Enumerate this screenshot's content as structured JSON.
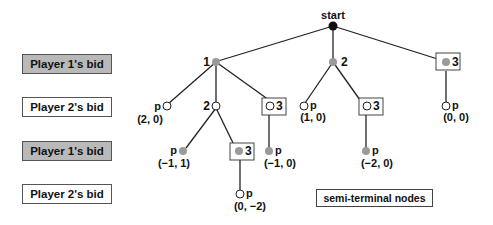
{
  "row_labels": [
    {
      "label": "Player 1's bid",
      "style": "shaded"
    },
    {
      "label": "Player 2's bid",
      "style": "plain"
    },
    {
      "label": "Player 1's bid",
      "style": "shaded"
    },
    {
      "label": "Player 2's bid",
      "style": "plain"
    }
  ],
  "tree": {
    "root_label": "start",
    "colors": {
      "root": "#111111",
      "player1_node": "#9a9a9a",
      "player2_node": "#ffffff",
      "edge": "#222222"
    },
    "level1": {
      "bid1": "1",
      "bid2": "2",
      "bid3": "3"
    },
    "level2": {
      "after1_pass": "p",
      "after1_pass_payoff": "(2, 0)",
      "after1_bid2": "2",
      "after1_bid3": "3",
      "after2_pass": "p",
      "after2_pass_payoff": "(1, 0)",
      "after2_bid3": "3",
      "after3_pass": "p",
      "after3_pass_payoff": "(0, 0)"
    },
    "level3": {
      "after12_pass": "p",
      "after12_pass_payoff": "(−1, 1)",
      "after12_bid3": "3",
      "after13_pass": "p",
      "after13_pass_payoff": "(−1, 0)",
      "after23_pass": "p",
      "after23_pass_payoff": "(−2, 0)"
    },
    "level4": {
      "after123_pass": "p",
      "after123_pass_payoff": "(0, −2)"
    }
  },
  "legend": {
    "semi_terminal": "semi-terminal nodes"
  }
}
